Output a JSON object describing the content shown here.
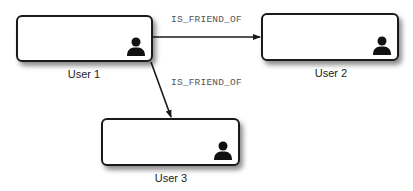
{
  "diagram": {
    "nodes": [
      {
        "id": "user1",
        "label": "User 1",
        "icon": "person-icon"
      },
      {
        "id": "user2",
        "label": "User 2",
        "icon": "person-icon"
      },
      {
        "id": "user3",
        "label": "User 3",
        "icon": "person-icon"
      }
    ],
    "edges": [
      {
        "from": "user1",
        "to": "user2",
        "label": "IS_FRIEND_OF"
      },
      {
        "from": "user1",
        "to": "user3",
        "label": "IS_FRIEND_OF"
      }
    ]
  }
}
